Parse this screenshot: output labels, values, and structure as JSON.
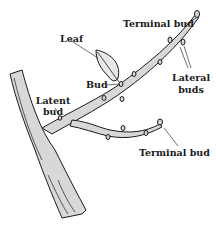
{
  "diagram": {
    "labels": {
      "terminal_bud_top": "Terminal bud",
      "leaf": "Leaf",
      "lateral_buds_line1": "Lateral",
      "lateral_buds_line2": "buds",
      "bud": "Bud",
      "latent_bud_line1": "Latent",
      "latent_bud_line2": "bud",
      "terminal_bud_bottom": "Terminal bud"
    },
    "colors": {
      "bark_fill": "#d8d8d8",
      "outline": "#1a1a1a",
      "leaf_fill": "#e8e8e8",
      "background": "#ffffff"
    }
  }
}
